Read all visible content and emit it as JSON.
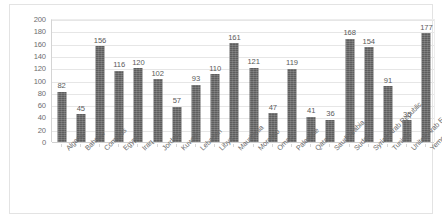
{
  "chart_data": {
    "type": "bar",
    "title": "",
    "subtitle": "",
    "xlabel": "",
    "ylabel": "",
    "ylim": [
      0,
      200
    ],
    "ytick_step": 20,
    "yticks": [
      "0",
      "20",
      "40",
      "60",
      "80",
      "100",
      "120",
      "140",
      "160",
      "180",
      "200"
    ],
    "grid": true,
    "legend": false,
    "bar_color": "#5e5e5e",
    "data_labels": true,
    "categories": [
      "Algeria",
      "Bahrain",
      "Comoros",
      "Egypt",
      "Iraq",
      "Jordan",
      "Kuwait",
      "Lebanon",
      "Libya",
      "Mauritania",
      "Morocco",
      "Oman",
      "Palestine",
      "Qatar",
      "Saudi Arabia",
      "Sudan",
      "Syrian Arab Republic",
      "Tunisia",
      "United Arab Emirates",
      "Yemen"
    ],
    "values": [
      82,
      45,
      156,
      116,
      120,
      102,
      57,
      93,
      110,
      161,
      121,
      47,
      119,
      41,
      36,
      168,
      154,
      91,
      35,
      177
    ]
  }
}
